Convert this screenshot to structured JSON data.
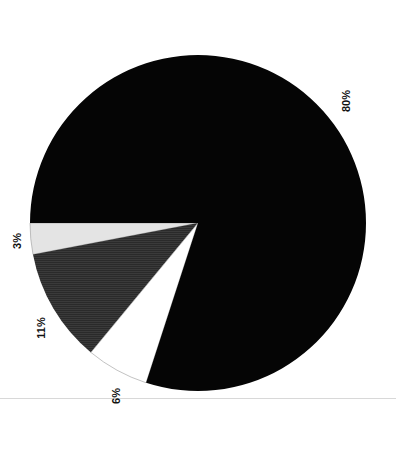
{
  "chart_data": {
    "type": "pie",
    "title": "",
    "orientation_note": "labels rotated 90° counterclockwise",
    "slices": [
      {
        "label": "80%",
        "value": 80,
        "color": "#050505"
      },
      {
        "label": "3%",
        "value": 3,
        "color": "#e4e4e4"
      },
      {
        "label": "11%",
        "value": 11,
        "color": "#3a3a3a"
      },
      {
        "label": "6%",
        "value": 6,
        "color": "#ffffff"
      }
    ],
    "legend": "none"
  },
  "labels": {
    "s80": "80%",
    "s3": "3%",
    "s11": "11%",
    "s6": "6%"
  }
}
